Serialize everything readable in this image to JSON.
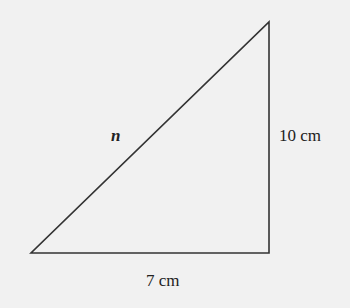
{
  "diagram": {
    "type": "right-triangle",
    "vertices": {
      "bottom_left": [
        31,
        253
      ],
      "bottom_right": [
        269,
        253
      ],
      "top_right": [
        269,
        22
      ]
    },
    "labels": {
      "hypotenuse": "n",
      "vertical_side": "10 cm",
      "horizontal_side": "7 cm"
    },
    "colors": {
      "background": "#f1f1f1",
      "stroke": "#333333"
    }
  }
}
